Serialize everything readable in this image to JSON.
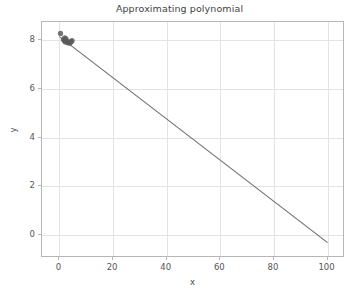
{
  "chart_data": {
    "type": "scatter",
    "title": "Approximating polynomial",
    "xlabel": "x",
    "ylabel": "y",
    "xlim": [
      -6.5,
      106.5
    ],
    "ylim": [
      -0.95,
      8.75
    ],
    "xticks": [
      0,
      20,
      40,
      60,
      80,
      100
    ],
    "yticks": [
      0,
      2,
      4,
      6,
      8
    ],
    "xtick_labels": [
      "0",
      "20",
      "40",
      "60",
      "80",
      "100"
    ],
    "ytick_labels": [
      "0",
      "2",
      "4",
      "6",
      "8"
    ],
    "grid": true,
    "legend": null,
    "series": [
      {
        "name": "data points",
        "type": "scatter",
        "marker": "circle",
        "color": "#5a5a5a",
        "marker_size": 4.2,
        "points": [
          {
            "x": 0.4,
            "y": 8.28
          },
          {
            "x": 1.5,
            "y": 8.03
          },
          {
            "x": 1.9,
            "y": 7.97
          },
          {
            "x": 2.3,
            "y": 7.93
          },
          {
            "x": 2.7,
            "y": 7.95
          },
          {
            "x": 3.1,
            "y": 7.9
          },
          {
            "x": 3.5,
            "y": 7.92
          },
          {
            "x": 3.9,
            "y": 7.88
          },
          {
            "x": 4.3,
            "y": 7.94
          },
          {
            "x": 4.7,
            "y": 7.98
          },
          {
            "x": 2.0,
            "y": 8.1
          },
          {
            "x": 2.5,
            "y": 8.05
          }
        ]
      },
      {
        "name": "approximating polynomial",
        "type": "line",
        "color": "#6e6e6e",
        "line_width": 1.1,
        "points": [
          {
            "x": 0.0,
            "y": 8.15
          },
          {
            "x": 100.0,
            "y": -0.32
          }
        ]
      }
    ]
  },
  "figure": {
    "background_color": "#ffffff",
    "axes_color": "#b6b6b6",
    "grid_color": "#e3e3e3",
    "tick_label_color": "#555555",
    "title_color": "#3f3f3f"
  }
}
